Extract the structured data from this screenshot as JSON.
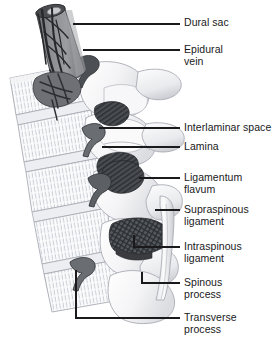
{
  "figure": {
    "background_color": "#ffffff",
    "line_color": "#1a1a1c",
    "text_color": "#19191b",
    "width": 277,
    "height": 344
  },
  "palette": {
    "bone_light": "#f6f6f7",
    "bone_shadow": "#d9dade",
    "bone_outline": "#a9acb4",
    "trabecular_hatch": "#b9c0cc",
    "dural_sac_gray": "#8d8f93",
    "dural_sac_dark": "#4a4c50",
    "vein_dark": "#2e3033",
    "ligament_dark": "#3a3c40",
    "ligament_hatch": "#6d7075",
    "leader_line": "#1a1a1c"
  },
  "labels": [
    {
      "id": "dural-sac",
      "text": "Dural sac",
      "lines": [
        "Dural sac"
      ],
      "text_x": 184,
      "text_y": 16,
      "leader": {
        "type": "straight",
        "x1": 73,
        "y1": 24,
        "x2": 180,
        "y2": 24
      }
    },
    {
      "id": "epidural-vein",
      "text": "Epidural vein",
      "lines": [
        "Epidural",
        "vein"
      ],
      "text_x": 184,
      "text_y": 43,
      "leader": {
        "type": "straight",
        "x1": 83,
        "y1": 50,
        "x2": 180,
        "y2": 50
      }
    },
    {
      "id": "interlaminar-space",
      "text": "Interlaminar space",
      "lines": [
        "Interlaminar space"
      ],
      "text_x": 184,
      "text_y": 121,
      "leader": {
        "type": "straight",
        "x1": 99,
        "y1": 128,
        "x2": 180,
        "y2": 128
      }
    },
    {
      "id": "lamina",
      "text": "Lamina",
      "lines": [
        "Lamina"
      ],
      "text_x": 184,
      "text_y": 140,
      "leader": {
        "type": "straight",
        "x1": 102,
        "y1": 147,
        "x2": 180,
        "y2": 147
      }
    },
    {
      "id": "ligamentum-flavum",
      "text": "Ligamentum flavum",
      "lines": [
        "Ligamentum",
        "flavum"
      ],
      "text_x": 184,
      "text_y": 171,
      "leader": {
        "type": "straight",
        "x1": 139,
        "y1": 178,
        "x2": 180,
        "y2": 178
      }
    },
    {
      "id": "supraspinous-ligament",
      "text": "Supraspinous ligament",
      "lines": [
        "Supraspinous",
        "ligament"
      ],
      "text_x": 184,
      "text_y": 203,
      "leader": {
        "type": "straight",
        "x1": 155,
        "y1": 210,
        "x2": 180,
        "y2": 210
      }
    },
    {
      "id": "intraspinous-ligament",
      "text": "Intraspinous ligament",
      "lines": [
        "Intraspinous",
        "ligament"
      ],
      "text_x": 184,
      "text_y": 240,
      "leader": {
        "type": "elbow",
        "x1": 134,
        "y1": 235,
        "ybend": 247,
        "x2": 180,
        "y2": 247
      }
    },
    {
      "id": "spinous-process",
      "text": "Spinous process",
      "lines": [
        "Spinous",
        "process"
      ],
      "text_x": 184,
      "text_y": 276,
      "leader": {
        "type": "elbow",
        "x1": 142,
        "y1": 272,
        "ybend": 283,
        "x2": 180,
        "y2": 283
      }
    },
    {
      "id": "transverse-process",
      "text": "Transverse process",
      "lines": [
        "Transverse",
        "process"
      ],
      "text_x": 184,
      "text_y": 311,
      "leader": {
        "type": "elbow",
        "x1": 76,
        "y1": 270,
        "ybend": 318,
        "x2": 180,
        "y2": 318
      }
    }
  ],
  "structures": [
    {
      "id": "dural-sac",
      "name": "Dural sac",
      "kind": "neural-sheath"
    },
    {
      "id": "epidural-vein",
      "name": "Epidural vein",
      "kind": "vessel"
    },
    {
      "id": "vertebral-body",
      "name": "Vertebral body",
      "kind": "bone"
    },
    {
      "id": "interlaminar-space",
      "name": "Interlaminar space",
      "kind": "space"
    },
    {
      "id": "lamina",
      "name": "Lamina",
      "kind": "bone"
    },
    {
      "id": "ligamentum-flavum",
      "name": "Ligamentum flavum",
      "kind": "ligament"
    },
    {
      "id": "supraspinous-ligament",
      "name": "Supraspinous ligament",
      "kind": "ligament"
    },
    {
      "id": "intraspinous-ligament",
      "name": "Intraspinous ligament",
      "kind": "ligament"
    },
    {
      "id": "spinous-process",
      "name": "Spinous process",
      "kind": "bone"
    },
    {
      "id": "transverse-process",
      "name": "Transverse process",
      "kind": "bone"
    }
  ]
}
